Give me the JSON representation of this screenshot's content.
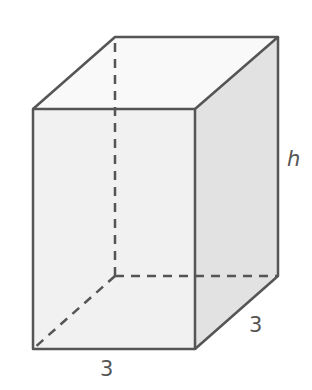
{
  "figure": {
    "type": "rectangular-prism",
    "labels": {
      "height": "h",
      "depth": "3",
      "width": "3"
    },
    "colors": {
      "edge": "#555555",
      "front_face": "#f1f1f1",
      "top_face": "#f9f9f9",
      "side_face": "#e2e2e2",
      "background": "#ffffff"
    },
    "vertices": {
      "front_top_left": [
        33,
        109
      ],
      "front_top_right": [
        195,
        109
      ],
      "front_bottom_left": [
        33,
        349
      ],
      "front_bottom_right": [
        195,
        349
      ],
      "back_top_left": [
        115,
        37
      ],
      "back_top_right": [
        278,
        37
      ],
      "back_bottom_left": [
        115,
        276
      ],
      "back_bottom_right": [
        278,
        276
      ]
    }
  }
}
